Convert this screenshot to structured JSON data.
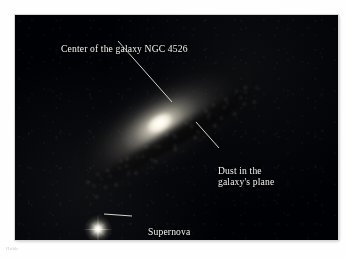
{
  "figure": {
    "subject": "NGC 4526",
    "caption_fragment": "Hubb"
  },
  "annotations": [
    {
      "id": "center",
      "text": "Center of the galaxy NGC 4526",
      "target": "galaxy-core"
    },
    {
      "id": "dust",
      "text": "Dust in the\ngalaxy's plane",
      "target": "dust-lane"
    },
    {
      "id": "supernova",
      "text": "Supernova",
      "target": "supernova-star"
    }
  ],
  "objects": {
    "galaxy_label": "galaxy-ngc-4526",
    "core_label": "galaxy-core",
    "dust_label": "dust-lane",
    "supernova_label": "supernova-star"
  },
  "colors": {
    "photo_background": "#000105",
    "label_text": "#f4f2ec",
    "leader_line": "#e8e6de",
    "core_highlight": "#ffffff",
    "page_background": "#fefefe"
  }
}
